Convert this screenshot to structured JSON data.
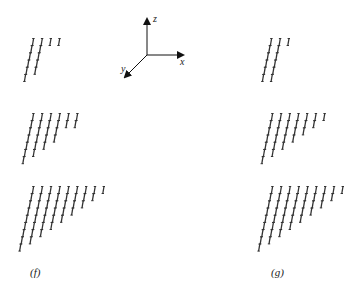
{
  "figure": {
    "panels": [
      {
        "id": "f",
        "label": "(f)",
        "label_pos": [
          30,
          276
        ],
        "groups": [
          {
            "origin": [
              33,
              42
            ],
            "column_heights": [
              6,
              5,
              1,
              1
            ],
            "spacing_x": 8.7
          },
          {
            "origin": [
              33,
              117
            ],
            "column_heights": [
              7,
              6,
              5,
              4,
              2,
              2
            ],
            "spacing_x": 8.8
          },
          {
            "origin": [
              33,
              190
            ],
            "column_heights": [
              9,
              8,
              7,
              6,
              5,
              4,
              3,
              2,
              1
            ],
            "spacing_x": 8.8
          }
        ]
      },
      {
        "id": "g",
        "label": "(g)",
        "label_pos": [
          271,
          276
        ],
        "groups": [
          {
            "origin": [
              271,
              42
            ],
            "column_heights": [
              6,
              6,
              1
            ],
            "spacing_x": 8.7
          },
          {
            "origin": [
              272,
              117
            ],
            "column_heights": [
              7,
              6,
              5,
              4,
              3,
              2,
              1
            ],
            "spacing_x": 8.7
          },
          {
            "origin": [
              272,
              190
            ],
            "column_heights": [
              9,
              8,
              7,
              6,
              5,
              4,
              3,
              2,
              1
            ],
            "spacing_x": 8.8
          }
        ]
      }
    ],
    "row_step": [
      -1.6,
      7.2
    ],
    "glyph": "I",
    "glyph_color": "#333333",
    "axes": {
      "origin": [
        147,
        55
      ],
      "z": {
        "label": "z",
        "tip": [
          147,
          19
        ],
        "label_pos": [
          153,
          13
        ]
      },
      "x": {
        "label": "x",
        "tip": [
          183,
          55
        ],
        "label_pos": [
          180,
          56
        ]
      },
      "y": {
        "label": "y",
        "tip": [
          125,
          77
        ],
        "label_pos": [
          121,
          63
        ]
      },
      "color": "#111111"
    }
  }
}
